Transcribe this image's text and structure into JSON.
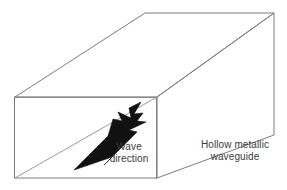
{
  "figure": {
    "name": "hollow-metallic-waveguide-diagram",
    "background_color": "#ffffff",
    "edge_color": "#7c7c7c",
    "arrow_color": "#111111",
    "text_color": "#3a3a3a"
  },
  "labels": {
    "wave_direction": {
      "line1": "Wave",
      "line2": "direction"
    },
    "waveguide_caption": {
      "line1": "Hollow metallic",
      "line2": "waveguide"
    }
  },
  "geometry": {
    "front_face": {
      "name": "open-aperture-front-face",
      "top_left": [
        15,
        97
      ],
      "top_right": [
        157,
        97
      ],
      "bottom_right": [
        157,
        178
      ],
      "bottom_left": [
        15,
        178
      ]
    },
    "back_face": {
      "name": "far-end-face",
      "top_left": [
        145,
        13
      ],
      "top_right": [
        274,
        13
      ],
      "bottom_right": [
        274,
        135
      ]
    },
    "interior_diagonal": {
      "from": [
        15,
        178
      ],
      "to": [
        157,
        97
      ]
    },
    "bottom_receding_edge": {
      "from": [
        157,
        178
      ],
      "to": [
        274,
        135
      ]
    },
    "top_left_receding_edge": {
      "from": [
        15,
        97
      ],
      "to": [
        145,
        13
      ]
    },
    "top_right_receding_edge": {
      "from": [
        157,
        97
      ],
      "to": [
        274,
        13
      ]
    }
  },
  "arrow": {
    "name": "wave-direction-arrow",
    "tail": [
      78,
      166
    ],
    "tip": [
      139,
      104
    ],
    "direction": "up-right"
  }
}
